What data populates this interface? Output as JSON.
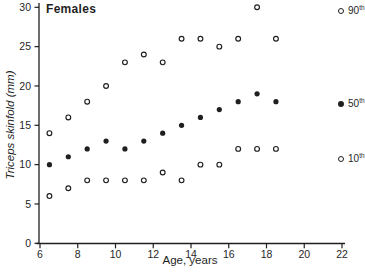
{
  "colors": {
    "ink": "#1f1f1f",
    "background": "#ffffff"
  },
  "chart_data": {
    "type": "scatter",
    "title": "Females",
    "xlabel": "Age,  years",
    "ylabel": "Triceps  skinfold  (mm)",
    "xlim": [
      6,
      22
    ],
    "ylim": [
      0,
      30
    ],
    "x_ticks": [
      6,
      8,
      10,
      12,
      14,
      16,
      18,
      20,
      22
    ],
    "y_ticks": [
      0,
      5,
      10,
      15,
      20,
      25,
      30
    ],
    "grid": false,
    "legend_position": "right-outside",
    "x": [
      6.5,
      7.5,
      8.5,
      9.5,
      10.5,
      11.5,
      12.5,
      13.5,
      14.5,
      15.5,
      16.5,
      17.5,
      18.5
    ],
    "series": [
      {
        "name": "90th",
        "marker": "open",
        "values": [
          14,
          16,
          18,
          20,
          23,
          24,
          23,
          26,
          26,
          25,
          26,
          30,
          26
        ]
      },
      {
        "name": "50th",
        "marker": "filled",
        "values": [
          10,
          11,
          12,
          13,
          12,
          13,
          14,
          15,
          16,
          17,
          18,
          19,
          18
        ]
      },
      {
        "name": "10th",
        "marker": "open",
        "values": [
          6,
          7,
          8,
          8,
          8,
          8,
          9,
          8,
          10,
          10,
          12,
          12,
          12
        ]
      }
    ],
    "legend": [
      {
        "base": "90",
        "sup": "th",
        "marker": "open",
        "row_y": 11
      },
      {
        "base": "50",
        "sup": "th",
        "marker": "filled",
        "row_y": 104
      },
      {
        "base": "10",
        "sup": "th",
        "marker": "open",
        "row_y": 159
      }
    ]
  }
}
